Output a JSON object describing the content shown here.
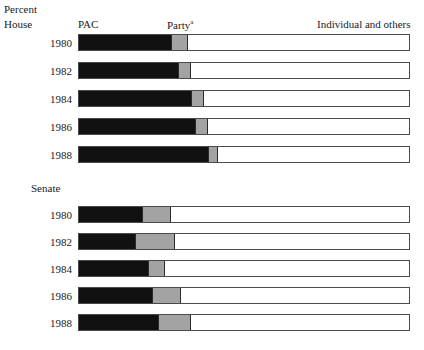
{
  "labels": {
    "percent": "Percent",
    "house": "House",
    "senate": "Senate",
    "pac": "PAC",
    "party": "Party",
    "party_footnote": "a",
    "individual": "Individual and others"
  },
  "colors": {
    "pac": "#111111",
    "party": "#a3a3a3",
    "individual": "#ffffff",
    "outline": "#4a4a4a",
    "text": "#1a1a1a"
  },
  "chart_data": {
    "type": "bar",
    "orientation": "horizontal",
    "stacked": true,
    "title": "Percent",
    "xlabel": "Percent",
    "ylabel": "",
    "xlim": [
      0,
      100
    ],
    "grid": false,
    "legend_position": "top",
    "legend": [
      "PAC",
      "Party",
      "Individual and others"
    ],
    "series": [
      {
        "name": "PAC",
        "color": "#111111"
      },
      {
        "name": "Party",
        "color": "#a3a3a3"
      },
      {
        "name": "Individual and others",
        "color": "#ffffff"
      }
    ],
    "groups": [
      {
        "name": "House",
        "categories": [
          "1980",
          "1982",
          "1984",
          "1986",
          "1988"
        ],
        "values": {
          "PAC": [
            28,
            30,
            34,
            35,
            39
          ],
          "Party": [
            5,
            4,
            4,
            4,
            3
          ],
          "Individual and others": [
            67,
            66,
            62,
            61,
            58
          ]
        }
      },
      {
        "name": "Senate",
        "categories": [
          "1980",
          "1982",
          "1984",
          "1986",
          "1988"
        ],
        "values": {
          "PAC": [
            19,
            17,
            21,
            22,
            24
          ],
          "Party": [
            9,
            12,
            5,
            9,
            10
          ],
          "Individual and others": [
            72,
            71,
            74,
            69,
            66
          ]
        }
      }
    ]
  },
  "house": {
    "name": "House",
    "rows": [
      {
        "year": "1980",
        "pac": 28,
        "party": 5,
        "individual": 67
      },
      {
        "year": "1982",
        "pac": 30,
        "party": 4,
        "individual": 66
      },
      {
        "year": "1984",
        "pac": 34,
        "party": 4,
        "individual": 62
      },
      {
        "year": "1986",
        "pac": 35,
        "party": 4,
        "individual": 61
      },
      {
        "year": "1988",
        "pac": 39,
        "party": 3,
        "individual": 58
      }
    ]
  },
  "senate": {
    "name": "Senate",
    "rows": [
      {
        "year": "1980",
        "pac": 19,
        "party": 9,
        "individual": 72
      },
      {
        "year": "1982",
        "pac": 17,
        "party": 12,
        "individual": 71
      },
      {
        "year": "1984",
        "pac": 21,
        "party": 5,
        "individual": 74
      },
      {
        "year": "1986",
        "pac": 22,
        "party": 9,
        "individual": 69
      },
      {
        "year": "1988",
        "pac": 24,
        "party": 10,
        "individual": 66
      }
    ]
  }
}
